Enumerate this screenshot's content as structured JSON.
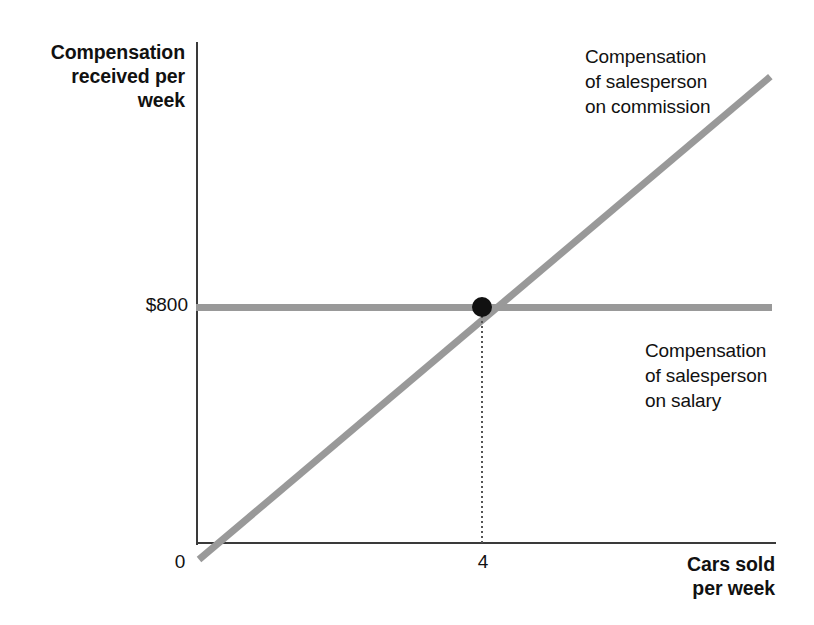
{
  "chart_data": {
    "type": "line",
    "title": "",
    "subtitle": "",
    "xlabel": "Cars sold per week",
    "ylabel": "Compensation received per week",
    "grid": false,
    "legend_position": "inline-annotations",
    "xlim": [
      0,
      8.2
    ],
    "ylim": [
      0,
      1425
    ],
    "x_ticks": [
      {
        "value": 0,
        "label": "0"
      },
      {
        "value": 4,
        "label": "4"
      }
    ],
    "y_ticks": [
      {
        "value": 800,
        "label": "$800"
      }
    ],
    "series": [
      {
        "name": "Compensation of salesperson on commission",
        "type": "line",
        "color": "#999999",
        "x": [
          0,
          8.2
        ],
        "values": [
          0,
          1425
        ],
        "slope_per_car": 200,
        "intercept": 0
      },
      {
        "name": "Compensation of salesperson on salary",
        "type": "line",
        "color": "#999999",
        "x": [
          0,
          8.2
        ],
        "values": [
          800,
          800
        ],
        "slope_per_car": 0,
        "intercept": 800
      }
    ],
    "annotations": [
      {
        "name": "intersection-point",
        "x": 4,
        "y": 800,
        "marker": "filled-circle",
        "color": "#111111"
      },
      {
        "name": "dropline",
        "from": [
          4,
          800
        ],
        "to": [
          4,
          0
        ],
        "style": "dotted"
      }
    ]
  },
  "axes": {
    "y_title": "Compensation\nreceived per\nweek",
    "x_title": "Cars sold\nper week",
    "y_tick_800": "$800",
    "x_tick_4": "4",
    "origin": "0"
  },
  "annotations": {
    "commission": "Compensation\nof salesperson\non commission",
    "salary": "Compensation\nof salesperson\non salary"
  },
  "colors": {
    "line": "#999999",
    "axis": "#3a3a3a",
    "marker": "#111111",
    "text": "#111111",
    "background": "#ffffff"
  }
}
